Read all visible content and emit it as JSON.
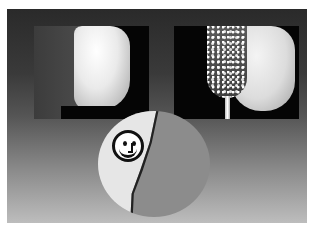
{
  "image": {
    "description": "Dental illustration: two photo panels of a tooth (before and with rotary diamond bur), and a circular diagram below with a smiley face on the light segment",
    "panels": [
      {
        "name": "tooth-photo",
        "subject": "tooth"
      },
      {
        "name": "tooth-with-bur-photo",
        "subject": "tooth with diamond bur"
      }
    ],
    "diagram": {
      "shape": "circle",
      "segments": [
        {
          "name": "light-segment",
          "color": "#e6e6e6"
        },
        {
          "name": "dark-segment",
          "color": "#8c8c8c"
        }
      ],
      "icon": "smiley-face-icon"
    },
    "colors": {
      "background_top": "#2a2a2a",
      "background_bottom": "#bdbdbd"
    }
  }
}
